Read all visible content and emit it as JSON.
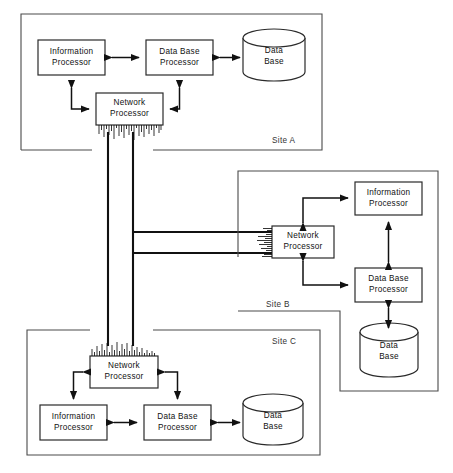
{
  "diagram": {
    "caption_fragment": "",
    "node_labels": {
      "information_processor": [
        "Information",
        "Processor"
      ],
      "data_base_processor": [
        "Data Base",
        "Processor"
      ],
      "network_processor": [
        "Network",
        "Processor"
      ],
      "data_base": [
        "Data",
        "Base"
      ]
    },
    "sites": [
      {
        "id": "site-a",
        "label": "Site A",
        "nodes": [
          {
            "name": "information-processor",
            "lines": [
              "Information",
              "Processor"
            ]
          },
          {
            "name": "data-base-processor",
            "lines": [
              "Data Base",
              "Processor"
            ]
          },
          {
            "name": "network-processor",
            "lines": [
              "Network",
              "Processor"
            ]
          },
          {
            "name": "data-base",
            "lines": [
              "Data",
              "Base"
            ]
          }
        ]
      },
      {
        "id": "site-b",
        "label": "Site B",
        "nodes": [
          {
            "name": "information-processor",
            "lines": [
              "Information",
              "Processor"
            ]
          },
          {
            "name": "data-base-processor",
            "lines": [
              "Data Base",
              "Processor"
            ]
          },
          {
            "name": "network-processor",
            "lines": [
              "Network",
              "Processor"
            ]
          },
          {
            "name": "data-base",
            "lines": [
              "Data",
              "Base"
            ]
          }
        ]
      },
      {
        "id": "site-c",
        "label": "Site C",
        "nodes": [
          {
            "name": "information-processor",
            "lines": [
              "Information",
              "Processor"
            ]
          },
          {
            "name": "data-base-processor",
            "lines": [
              "Data Base",
              "Processor"
            ]
          },
          {
            "name": "network-processor",
            "lines": [
              "Network",
              "Processor"
            ]
          },
          {
            "name": "data-base",
            "lines": [
              "Data",
              "Base"
            ]
          }
        ]
      }
    ],
    "colors": {
      "line": "#111111",
      "site_border": "#4a4a4a",
      "box_fill": "#ffffff",
      "background": "#ffffff",
      "text": "#111111"
    }
  },
  "site_a": {
    "label": "Site A",
    "information_processor_l1": "Information",
    "information_processor_l2": "Processor",
    "data_base_processor_l1": "Data Base",
    "data_base_processor_l2": "Processor",
    "network_processor_l1": "Network",
    "network_processor_l2": "Processor",
    "data_base_l1": "Data",
    "data_base_l2": "Base"
  },
  "site_b": {
    "label": "Site B",
    "information_processor_l1": "Information",
    "information_processor_l2": "Processor",
    "data_base_processor_l1": "Data Base",
    "data_base_processor_l2": "Processor",
    "network_processor_l1": "Network",
    "network_processor_l2": "Processor",
    "data_base_l1": "Data",
    "data_base_l2": "Base"
  },
  "site_c": {
    "label": "Site C",
    "information_processor_l1": "Information",
    "information_processor_l2": "Processor",
    "data_base_processor_l1": "Data Base",
    "data_base_processor_l2": "Processor",
    "network_processor_l1": "Network",
    "network_processor_l2": "Processor",
    "data_base_l1": "Data",
    "data_base_l2": "Base"
  }
}
